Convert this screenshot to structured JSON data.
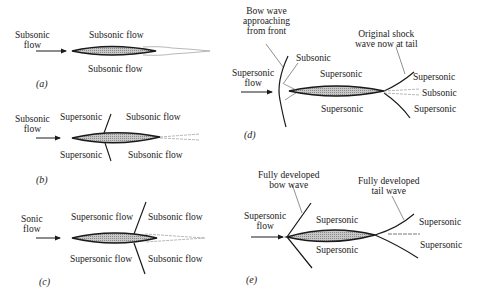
{
  "panels": {
    "a": {
      "caption": "(a)",
      "inflow": [
        "Subsonic",
        "flow"
      ],
      "upper": "Subsonic flow",
      "lower": "Subsonic flow"
    },
    "b": {
      "caption": "(b)",
      "inflow": [
        "Subsonic",
        "flow"
      ],
      "upper_left": "Supersonic",
      "upper_right": "Subsonic flow",
      "lower_left": "Supersonic",
      "lower_right": "Subsonic flow"
    },
    "c": {
      "caption": "(c)",
      "inflow": [
        "Sonic",
        "flow"
      ],
      "upper_left": "Supersonic flow",
      "upper_right": "Subsonic flow",
      "lower_left": "Supersonic flow",
      "lower_right": "Subsonic flow"
    },
    "d": {
      "caption": "(d)",
      "inflow": [
        "Supersonic",
        "flow"
      ],
      "bow_note": [
        "Bow wave",
        "approaching",
        "from front"
      ],
      "tail_note": [
        "Original shock",
        "wave now at tail"
      ],
      "front_region": "Subsonic",
      "upper": "Supersonic",
      "lower": "Supersonic",
      "tail_upper": "Supersonic",
      "tail_mid": "Subsonic",
      "tail_lower": "Supersonic"
    },
    "e": {
      "caption": "(e)",
      "inflow": [
        "Supersonic",
        "flow"
      ],
      "bow_note": [
        "Fully developed",
        "bow wave"
      ],
      "tail_note": [
        "Fully developed",
        "tail wave"
      ],
      "upper": "Supersonic",
      "lower": "Supersonic",
      "tail_upper": "Supersonic",
      "tail_lower": "Supersonic"
    }
  }
}
